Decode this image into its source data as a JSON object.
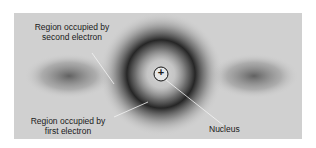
{
  "diagram": {
    "labels": {
      "second_electron": [
        "Region occupied by",
        "second electron"
      ],
      "first_electron": [
        "Region occupied by",
        "first electron"
      ],
      "nucleus": "Nucleus"
    },
    "nucleus_symbol": "+",
    "colors": {
      "background": "#d0d0d0",
      "shade_dark": "#2a2a2a",
      "leader_line": "#f2f2f2"
    }
  }
}
